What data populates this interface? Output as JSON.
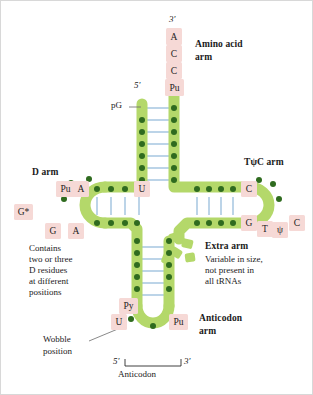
{
  "figure": {
    "colors": {
      "backbone_green": "#b4d86a",
      "backbone_edge": "#a3cc55",
      "nucleotide_dot": "#2f6b1f",
      "base_box_pink": "#f6d9d6",
      "hbond_blue": "#8fb7d9",
      "text": "#1a1a1a",
      "background": "#ffffff"
    }
  },
  "arms": {
    "amino_acid": {
      "label_line1": "Amino acid",
      "label_line2": "arm",
      "three_prime": "3'",
      "five_prime": "5'",
      "tail_bases": [
        "A",
        "C",
        "C",
        "Pu"
      ],
      "five_prime_base": "pG",
      "stem_pairs": 7
    },
    "d_arm": {
      "label": "D arm",
      "note_lines": [
        "Contains",
        "two or three",
        "D residues",
        "at different",
        "positions"
      ],
      "loop_bases": [
        "Pu",
        "G*",
        "G",
        "A"
      ],
      "stem_base": "A",
      "junction_base": "U",
      "stem_pairs": 4
    },
    "tpsic_arm": {
      "label": "TψC arm",
      "loop_bases": [
        "C",
        "G",
        "T",
        "ψ",
        "C"
      ],
      "stem_pairs": 5
    },
    "extra_arm": {
      "label": "Extra arm",
      "note_lines": [
        "Variable in size,",
        "not present in",
        "all tRNAs"
      ]
    },
    "anticodon_arm": {
      "label_line1": "Anticodon",
      "label_line2": "arm",
      "loop_bases": [
        "Py",
        "U",
        "Pu"
      ],
      "wobble_line1": "Wobble",
      "wobble_line2": "position",
      "bracket_five": "5'",
      "bracket_three": "3'",
      "bracket_label": "Anticodon",
      "stem_pairs": 5
    }
  }
}
